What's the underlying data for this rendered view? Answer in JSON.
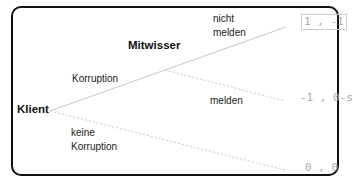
{
  "nodes": {
    "root": "Klient",
    "second": "Mitwisser"
  },
  "edges": {
    "corruption": "Korruption",
    "no_corruption_line1": "keine",
    "no_corruption_line2": "Korruption",
    "not_report_line1": "nicht",
    "not_report_line2": "melden",
    "report": "melden"
  },
  "payoffs": {
    "not_report": "1 , -1",
    "report": "-1 , 0-s",
    "no_corruption": "0 , 0"
  },
  "colors": {
    "line": "#c8c8c8",
    "border": "#111111",
    "payoff_text": "#aaaaaa"
  }
}
